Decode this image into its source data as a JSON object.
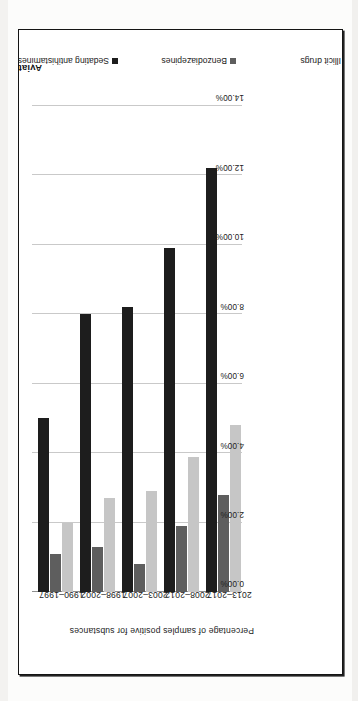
{
  "figure": {
    "orientation_note": "chart printed rotated 90 degrees on page"
  },
  "chart_data": {
    "type": "bar",
    "orientation": "horizontal",
    "title": "",
    "xlabel": "Percentage of samples positive for substances",
    "ylabel": "Aviation accident year",
    "categories": [
      "1990–1997",
      "1998–2002",
      "2003–2007",
      "2008–2012",
      "2013–2017"
    ],
    "series": [
      {
        "name": "Sedating antihistamines",
        "color": "#1d1d1d",
        "values": [
          5.0,
          8.0,
          8.2,
          9.9,
          12.2
        ]
      },
      {
        "name": "Benzodiazepines",
        "color": "#5e5e5e",
        "values": [
          1.1,
          1.3,
          0.8,
          1.9,
          2.8
        ]
      },
      {
        "name": "Illicit drugs",
        "color": "#c6c6c6",
        "values": [
          2.0,
          2.7,
          2.9,
          3.9,
          4.8
        ]
      }
    ],
    "xlim": [
      0,
      14
    ],
    "ticks": [
      "0.00%",
      "2.00%",
      "4.00%",
      "6.00%",
      "8.00%",
      "10.00%",
      "12.00%",
      "14.00%"
    ],
    "tick_values": [
      0,
      2,
      4,
      6,
      8,
      10,
      12,
      14
    ],
    "grid": true,
    "legend_position": "bottom"
  },
  "axes": {
    "value_axis_title": "Percentage of samples positive for substances",
    "category_axis_title": "Aviation accident year"
  },
  "legend": {
    "items": [
      {
        "label": "Sedating antihistamines"
      },
      {
        "label": "Benzodiazepines"
      },
      {
        "label": "Illicit drugs"
      }
    ]
  }
}
